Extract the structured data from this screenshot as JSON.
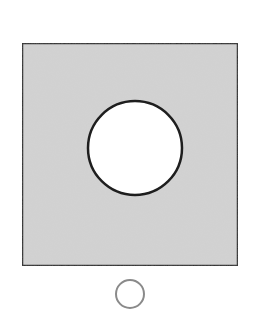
{
  "diagram": {
    "square": {
      "x": 22,
      "y": 43,
      "width": 216,
      "height": 223,
      "fill": "#d3d3d3",
      "stroke": "#2a2a2a",
      "stroke_width": 2.5
    },
    "hole": {
      "cx": 135,
      "cy": 148,
      "r": 47,
      "fill": "#ffffff",
      "stroke": "#1e1e1e",
      "stroke_width": 2.5
    },
    "small_circle": {
      "cx": 130,
      "cy": 294,
      "r": 14,
      "fill": "#ffffff",
      "stroke": "#8a8a8a",
      "stroke_width": 2
    }
  }
}
